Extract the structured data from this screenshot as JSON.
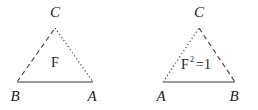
{
  "figure": {
    "background_color": "#ffffff",
    "stroke_color": "#4a4a4a",
    "base_stroke_color": "#9a9a9a",
    "text_color": "#1b1b1b",
    "width": 258,
    "height": 110,
    "diagrams": [
      {
        "id": "left-triangle",
        "interior_label": "F",
        "interior_superscript": "",
        "interior_equals": "",
        "apex": {
          "label": "C",
          "x": 55,
          "y": 28,
          "label_x": 55,
          "label_y": 17
        },
        "base_left": {
          "label": "B",
          "x": 17,
          "y": 82,
          "label_x": 15,
          "label_y": 101
        },
        "base_right": {
          "label": "A",
          "x": 93,
          "y": 82,
          "label_x": 92,
          "label_y": 101
        },
        "edges": [
          {
            "name": "edge-base-left-to-apex",
            "style": "dashed",
            "from": "base_left",
            "to": "apex"
          },
          {
            "name": "edge-apex-to-base-right",
            "style": "dotted",
            "from": "apex",
            "to": "base_right"
          },
          {
            "name": "edge-base",
            "style": "solid",
            "from": "base_left",
            "to": "base_right"
          }
        ],
        "interior_label_x": 55,
        "interior_label_y": 67
      },
      {
        "id": "right-triangle",
        "interior_label": "F",
        "interior_superscript": "2",
        "interior_equals": "=1",
        "apex": {
          "label": "C",
          "x": 199,
          "y": 28,
          "label_x": 199,
          "label_y": 17
        },
        "base_left": {
          "label": "A",
          "x": 163,
          "y": 82,
          "label_x": 161,
          "label_y": 101
        },
        "base_right": {
          "label": "B",
          "x": 235,
          "y": 82,
          "label_x": 234,
          "label_y": 101
        },
        "edges": [
          {
            "name": "edge-base-left-to-apex",
            "style": "dotted",
            "from": "base_left",
            "to": "apex"
          },
          {
            "name": "edge-apex-to-base-right",
            "style": "dashed",
            "from": "apex",
            "to": "base_right"
          },
          {
            "name": "edge-base",
            "style": "solid",
            "from": "base_left",
            "to": "base_right"
          }
        ],
        "interior_label_x": 185,
        "interior_label_y": 69
      }
    ]
  }
}
